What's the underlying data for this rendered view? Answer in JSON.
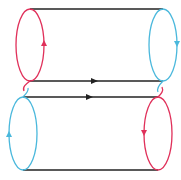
{
  "diagram": {
    "title": "",
    "colors": {
      "edge": "#222222",
      "red": "#e0305a",
      "blue": "#4ab8dc",
      "background": "#ffffff"
    },
    "cylinders": [
      {
        "name": "top-cylinder",
        "left_cap": {
          "color": "red",
          "orientation": "up"
        },
        "right_cap": {
          "color": "blue",
          "orientation": "down"
        },
        "edge_arrow": {
          "edge": "bottom",
          "direction": "right"
        }
      },
      {
        "name": "bottom-cylinder",
        "left_cap": {
          "color": "blue",
          "orientation": "up"
        },
        "right_cap": {
          "color": "red",
          "orientation": "down"
        },
        "edge_arrow": {
          "edge": "top",
          "direction": "right"
        }
      }
    ],
    "connections": [
      {
        "from": "top-cylinder.left_cap",
        "to": "bottom-cylinder.left_cap",
        "style": "s-curve crossing"
      },
      {
        "from": "top-cylinder.right_cap",
        "to": "bottom-cylinder.right_cap",
        "style": "s-curve crossing"
      }
    ]
  }
}
